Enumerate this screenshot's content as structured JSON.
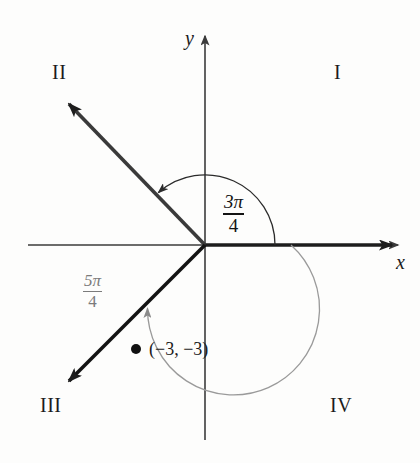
{
  "figure": {
    "background_color": "#fdfdfc"
  },
  "axes": {
    "x_label": "x",
    "y_label": "y",
    "axis_color": "#3b3b3b",
    "origin": {
      "x": 205,
      "y": 245
    }
  },
  "quadrants": [
    {
      "id": "I",
      "label": "I",
      "x": 334,
      "y": 62
    },
    {
      "id": "II",
      "label": "II",
      "x": 52,
      "y": 62
    },
    {
      "id": "III",
      "label": "III",
      "x": 40,
      "y": 395
    },
    {
      "id": "IV",
      "label": "IV",
      "x": 330,
      "y": 395
    }
  ],
  "angles": [
    {
      "name": "positive-angle",
      "numerator": "3π",
      "denominator": "4",
      "measure_radians": 2.356194,
      "degrees": 135,
      "direction": "counterclockwise",
      "color": "#141414",
      "arc_radius": 70,
      "label_x": 222,
      "label_y": 196
    },
    {
      "name": "negative-reference-angle",
      "numerator": "5π",
      "denominator": "4",
      "measure_radians": 3.926991,
      "degrees": 225,
      "direction": "clockwise",
      "color": "#7b7b7b",
      "arc_radius": 86,
      "label_x": 82,
      "label_y": 275
    }
  ],
  "rays": [
    {
      "name": "terminal-ray-quadrant-II",
      "degrees": 135,
      "color": "#2a2a2a",
      "length": 205,
      "arrowhead": true
    },
    {
      "name": "terminal-ray-quadrant-III",
      "degrees": 225,
      "color": "#151515",
      "length": 205,
      "arrowhead": true
    }
  ],
  "points": [
    {
      "name": "plotted-point",
      "label": "(−3, −3)",
      "x_value": -3,
      "y_value": -3,
      "pixel_x": 136,
      "pixel_y": 349,
      "label_x": 150,
      "label_y": 341,
      "color": "#111111"
    }
  ]
}
